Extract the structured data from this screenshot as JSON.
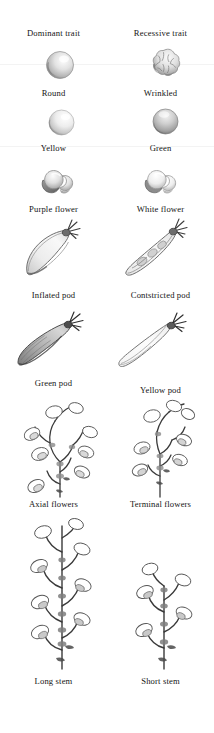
{
  "figure": {
    "width": 214,
    "height": 733,
    "background": "#ffffff",
    "ink_color": "#1a1a1a",
    "style": "pencil botanical illustration"
  },
  "columns": [
    {
      "key": "dominant",
      "header": "Dominant trait"
    },
    {
      "key": "recessive",
      "header": "Recessive trait"
    }
  ],
  "traits": [
    {
      "name": "seed-shape",
      "dominant_label": "Round",
      "recessive_label": "Wrinkled",
      "dominant_icon": "round-pea-seed",
      "recessive_icon": "wrinkled-pea-seed"
    },
    {
      "name": "seed-color",
      "dominant_label": "Yellow",
      "recessive_label": "Green",
      "dominant_icon": "yellow-pea-seed",
      "recessive_icon": "green-pea-seed"
    },
    {
      "name": "flower-color",
      "dominant_label": "Purple flower",
      "recessive_label": "White flower",
      "dominant_icon": "purple-pea-flower",
      "recessive_icon": "white-pea-flower"
    },
    {
      "name": "pod-shape",
      "dominant_label": "Inflated pod",
      "recessive_label": "Contstricted pod",
      "dominant_icon": "inflated-pea-pod",
      "recessive_icon": "constricted-pea-pod"
    },
    {
      "name": "pod-color",
      "dominant_label": "Green pod",
      "recessive_label": "Yellow pod",
      "dominant_icon": "green-pea-pod",
      "recessive_icon": "yellow-pea-pod"
    },
    {
      "name": "flower-position",
      "dominant_label": "Axial flowers",
      "recessive_label": "Terminal flowers",
      "dominant_icon": "axial-flower-stem",
      "recessive_icon": "terminal-flower-stem"
    },
    {
      "name": "stem-length",
      "dominant_label": "Long stem",
      "recessive_label": "Short stem",
      "dominant_icon": "long-pea-stem",
      "recessive_icon": "short-pea-stem"
    }
  ]
}
